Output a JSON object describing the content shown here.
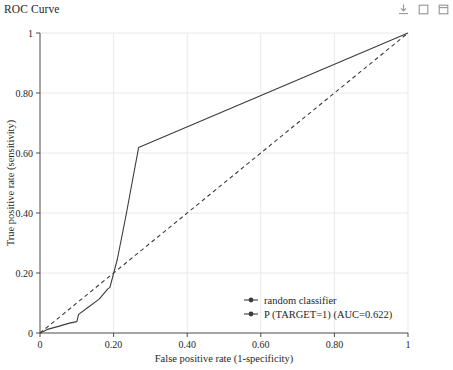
{
  "panel": {
    "title": "ROC Curve"
  },
  "toolbar": {
    "buttons": [
      {
        "name": "download-icon",
        "label": "Download"
      },
      {
        "name": "copy-icon",
        "label": "Copy"
      },
      {
        "name": "expand-icon",
        "label": "Expand"
      }
    ]
  },
  "chart_data": {
    "type": "line",
    "title": "ROC Curve",
    "xlabel": "False positive rate (1-specificity)",
    "ylabel": "True positive rate (sensitivity)",
    "xlim": [
      0,
      1
    ],
    "ylim": [
      0,
      1
    ],
    "grid": true,
    "legend_position": "bottom-right",
    "xticks": [
      0,
      0.2,
      0.4,
      0.6,
      0.8,
      1
    ],
    "xtick_labels": [
      "0",
      "0.20",
      "0.40",
      "0.60",
      "0.80",
      "1"
    ],
    "yticks": [
      0,
      0.2,
      0.4,
      0.6,
      0.8,
      1
    ],
    "ytick_labels": [
      "0",
      "0.20",
      "0.40",
      "0.60",
      "0.80",
      "1"
    ],
    "series": [
      {
        "name": "random classifier",
        "style": "dashed",
        "color": "#3c3c3c",
        "x": [
          0,
          1
        ],
        "y": [
          0,
          1
        ]
      },
      {
        "name": "P (TARGET=1) (AUC=0.622)",
        "style": "solid",
        "color": "#3c3c3c",
        "auc": 0.622,
        "x": [
          0,
          0.02,
          0.05,
          0.08,
          0.1,
          0.105,
          0.13,
          0.16,
          0.185,
          0.19,
          0.21,
          0.235,
          0.25,
          0.268,
          1
        ],
        "y": [
          0,
          0.012,
          0.022,
          0.033,
          0.038,
          0.062,
          0.085,
          0.112,
          0.148,
          0.152,
          0.245,
          0.4,
          0.5,
          0.618,
          1
        ]
      }
    ],
    "legend": [
      {
        "label": "random classifier",
        "style": "dashed",
        "marker": "circle",
        "color": "#3c3c3c"
      },
      {
        "label": "P (TARGET=1) (AUC=0.622)",
        "style": "solid",
        "marker": "circle",
        "color": "#3c3c3c"
      }
    ]
  }
}
